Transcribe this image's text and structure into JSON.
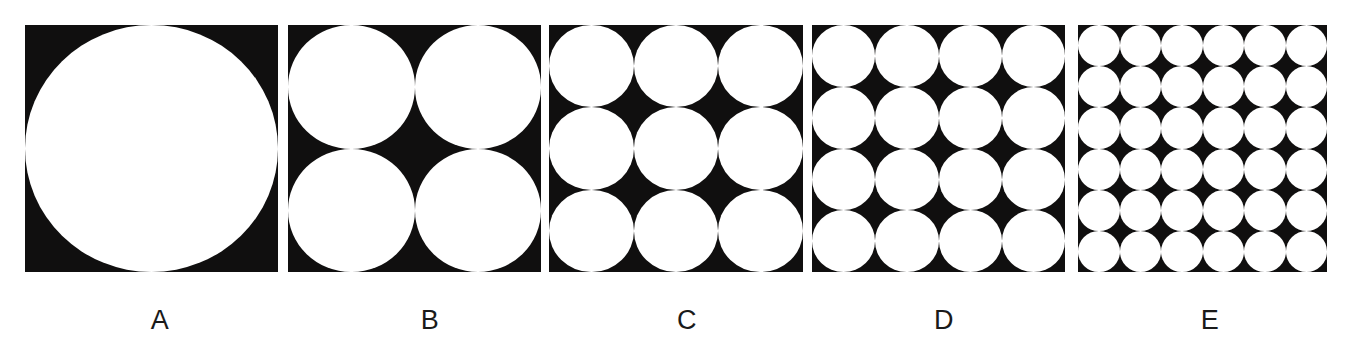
{
  "figure": {
    "background_color": "#ffffff",
    "square_color": "#100f0f",
    "circle_color": "#ffffff",
    "label_color": "#1a1a1a",
    "panel_top": 25,
    "panel_height": 247,
    "label_y": 307
  },
  "panels": [
    {
      "label": "A",
      "grid": 1,
      "circle_count": 1,
      "x": 25,
      "width": 253,
      "label_center_x": 160
    },
    {
      "label": "B",
      "grid": 2,
      "circle_count": 4,
      "x": 288,
      "width": 253,
      "label_center_x": 430
    },
    {
      "label": "C",
      "grid": 3,
      "circle_count": 9,
      "x": 549,
      "width": 254,
      "label_center_x": 687
    },
    {
      "label": "D",
      "grid": 4,
      "circle_count": 16,
      "x": 812,
      "width": 253,
      "label_center_x": 944
    },
    {
      "label": "E",
      "grid": 6,
      "circle_count": 36,
      "x": 1078,
      "width": 249,
      "label_center_x": 1210
    }
  ],
  "chart_data": {
    "type": "diagram",
    "categories": [
      "A",
      "B",
      "C",
      "D",
      "E"
    ],
    "series": [
      {
        "name": "Circles per side",
        "values": [
          1,
          2,
          3,
          4,
          6
        ]
      },
      {
        "name": "Total circles",
        "values": [
          1,
          4,
          9,
          16,
          36
        ]
      }
    ],
    "xlabel": "",
    "ylabel": "",
    "legend": "none",
    "grid": false
  }
}
